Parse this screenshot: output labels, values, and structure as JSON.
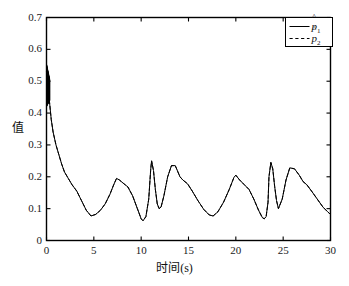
{
  "chart_data": {
    "type": "line",
    "title": "",
    "xlabel": "时间(s)",
    "ylabel": "值",
    "xlim": [
      0,
      30
    ],
    "ylim": [
      0,
      0.7
    ],
    "xticks": [
      0,
      5,
      10,
      15,
      20,
      25,
      30
    ],
    "xtick_labels": [
      "0",
      "5",
      "10",
      "15",
      "20",
      "25",
      "30"
    ],
    "yticks": [
      0,
      0.1,
      0.2,
      0.3,
      0.4,
      0.5,
      0.6,
      0.7
    ],
    "ytick_labels": [
      "0",
      "0.1",
      "0.2",
      "0.3",
      "0.4",
      "0.5",
      "0.6",
      "0.7"
    ],
    "grid": false,
    "legend_position": "upper-right",
    "legend": [
      {
        "label": "p̂1",
        "base": "p",
        "sub": "1",
        "style": "solid"
      },
      {
        "label": "p̂2",
        "base": "p",
        "sub": "2",
        "style": "dashed"
      }
    ],
    "series": [
      {
        "name": "p̂1",
        "style": "solid",
        "color": "#000000",
        "note": "overlaps p̂2 almost exactly; hidden beneath dashed curve",
        "x": [
          0.0,
          0.1,
          0.2,
          0.3,
          0.4,
          0.5,
          0.7,
          1.0,
          1.3,
          1.6,
          1.9,
          2.3,
          2.7,
          3.2,
          3.7,
          4.2,
          4.7,
          5.2,
          5.7,
          6.2,
          6.7,
          7.1,
          7.4,
          7.7,
          8.1,
          8.6,
          9.1,
          9.6,
          10.0,
          10.2,
          10.5,
          10.8,
          11.0,
          11.1,
          11.3,
          11.5,
          11.7,
          11.9,
          12.1,
          12.4,
          12.8,
          13.2,
          13.6,
          14.1,
          14.4,
          14.9,
          15.4,
          16.0,
          16.6,
          17.2,
          17.6,
          18.1,
          18.7,
          19.3,
          19.8,
          20.0,
          20.4,
          20.9,
          21.4,
          21.9,
          22.4,
          22.8,
          23.0,
          23.2,
          23.4,
          23.5,
          23.7,
          23.9,
          24.1,
          24.3,
          24.5,
          24.9,
          25.3,
          25.7,
          26.2,
          26.7,
          27.1,
          27.5,
          28.0,
          28.6,
          29.2,
          29.7,
          30.0
        ],
        "y": [
          0.53,
          0.5,
          0.47,
          0.44,
          0.41,
          0.38,
          0.34,
          0.3,
          0.27,
          0.24,
          0.215,
          0.195,
          0.175,
          0.155,
          0.125,
          0.095,
          0.077,
          0.082,
          0.095,
          0.115,
          0.145,
          0.175,
          0.195,
          0.19,
          0.18,
          0.168,
          0.14,
          0.1,
          0.068,
          0.062,
          0.075,
          0.13,
          0.22,
          0.25,
          0.22,
          0.16,
          0.115,
          0.1,
          0.105,
          0.14,
          0.2,
          0.235,
          0.235,
          0.2,
          0.19,
          0.178,
          0.155,
          0.125,
          0.098,
          0.08,
          0.077,
          0.09,
          0.12,
          0.16,
          0.198,
          0.205,
          0.19,
          0.175,
          0.16,
          0.13,
          0.095,
          0.072,
          0.068,
          0.075,
          0.12,
          0.2,
          0.245,
          0.225,
          0.17,
          0.125,
          0.1,
          0.13,
          0.19,
          0.228,
          0.225,
          0.205,
          0.185,
          0.175,
          0.155,
          0.13,
          0.105,
          0.09,
          0.082
        ]
      },
      {
        "name": "p̂2",
        "style": "dashed",
        "color": "#000000",
        "x": [
          0.0,
          0.1,
          0.2,
          0.3,
          0.4,
          0.5,
          0.7,
          1.0,
          1.3,
          1.6,
          1.9,
          2.3,
          2.7,
          3.2,
          3.7,
          4.2,
          4.7,
          5.2,
          5.7,
          6.2,
          6.7,
          7.1,
          7.4,
          7.7,
          8.1,
          8.6,
          9.1,
          9.6,
          10.0,
          10.2,
          10.5,
          10.8,
          11.0,
          11.1,
          11.3,
          11.5,
          11.7,
          11.9,
          12.1,
          12.4,
          12.8,
          13.2,
          13.6,
          14.1,
          14.4,
          14.9,
          15.4,
          16.0,
          16.6,
          17.2,
          17.6,
          18.1,
          18.7,
          19.3,
          19.8,
          20.0,
          20.4,
          20.9,
          21.4,
          21.9,
          22.4,
          22.8,
          23.0,
          23.2,
          23.4,
          23.5,
          23.7,
          23.9,
          24.1,
          24.3,
          24.5,
          24.9,
          25.3,
          25.7,
          26.2,
          26.7,
          27.1,
          27.5,
          28.0,
          28.6,
          29.2,
          29.7,
          30.0
        ],
        "y": [
          0.53,
          0.5,
          0.47,
          0.44,
          0.41,
          0.38,
          0.34,
          0.3,
          0.27,
          0.24,
          0.215,
          0.195,
          0.175,
          0.155,
          0.125,
          0.095,
          0.077,
          0.082,
          0.095,
          0.115,
          0.145,
          0.175,
          0.195,
          0.19,
          0.18,
          0.168,
          0.14,
          0.1,
          0.068,
          0.062,
          0.075,
          0.13,
          0.22,
          0.25,
          0.22,
          0.16,
          0.115,
          0.1,
          0.105,
          0.14,
          0.2,
          0.235,
          0.235,
          0.2,
          0.19,
          0.178,
          0.155,
          0.125,
          0.098,
          0.08,
          0.077,
          0.09,
          0.12,
          0.16,
          0.198,
          0.205,
          0.19,
          0.175,
          0.16,
          0.13,
          0.095,
          0.072,
          0.068,
          0.075,
          0.12,
          0.2,
          0.245,
          0.225,
          0.17,
          0.125,
          0.1,
          0.13,
          0.19,
          0.228,
          0.225,
          0.205,
          0.185,
          0.175,
          0.155,
          0.13,
          0.105,
          0.09,
          0.082
        ]
      }
    ],
    "startup_transient": {
      "note": "dense vertical chatter at t≈0 between 0.42 and 0.55",
      "x_range": [
        0.0,
        0.35
      ],
      "y_range": [
        0.42,
        0.555
      ]
    }
  }
}
